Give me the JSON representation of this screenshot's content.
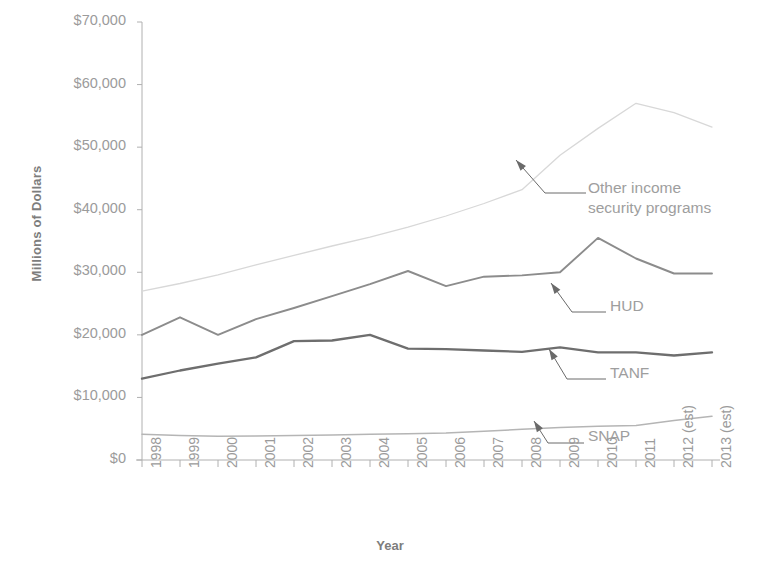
{
  "chart": {
    "type": "line",
    "title": "",
    "xlabel": "Year",
    "ylabel": "Millions of Dollars"
  },
  "axes": {
    "y_ticks": [
      "$0",
      "$10,000",
      "$20,000",
      "$30,000",
      "$40,000",
      "$50,000",
      "$60,000",
      "$70,000"
    ],
    "x_ticks": [
      "1998",
      "1999",
      "2000",
      "2001",
      "2002",
      "2003",
      "2004",
      "2005",
      "2006",
      "2007",
      "2008",
      "2009",
      "2010",
      "2011",
      "2012 (est)",
      "2013 (est)"
    ]
  },
  "annotations": {
    "other_line1": "Other income",
    "other_line2": "security programs",
    "hud": "HUD",
    "tanf": "TANF",
    "snap": "SNAP"
  },
  "colors": {
    "other": "#d8d8d8",
    "hud": "#8c8c8c",
    "tanf": "#6e6e6e",
    "snap": "#b5b5b5",
    "axis": "#b0b0b0",
    "text": "#9b9b9b"
  },
  "chart_data": {
    "type": "line",
    "title": "",
    "xlabel": "Year",
    "ylabel": "Millions of Dollars",
    "ylim": [
      0,
      70000
    ],
    "grid": false,
    "legend_position": "inline-annotations",
    "categories": [
      "1998",
      "1999",
      "2000",
      "2001",
      "2002",
      "2003",
      "2004",
      "2005",
      "2006",
      "2007",
      "2008",
      "2009",
      "2010",
      "2011",
      "2012 (est)",
      "2013 (est)"
    ],
    "series": [
      {
        "name": "Other income security programs",
        "color": "#d8d8d8",
        "values": [
          27000,
          28200,
          29600,
          31200,
          32700,
          34200,
          35600,
          37200,
          39000,
          41000,
          43200,
          48700,
          53000,
          57000,
          55500,
          53200
        ]
      },
      {
        "name": "HUD",
        "color": "#8c8c8c",
        "values": [
          20000,
          22800,
          20000,
          22500,
          24300,
          26200,
          28100,
          30200,
          27800,
          29300,
          29500,
          30000,
          35500,
          32200,
          29800,
          29800
        ]
      },
      {
        "name": "TANF",
        "color": "#6e6e6e",
        "values": [
          13000,
          14300,
          15400,
          16400,
          19000,
          19100,
          20000,
          17800,
          17700,
          17500,
          17300,
          18000,
          17200,
          17200,
          16700,
          17200
        ]
      },
      {
        "name": "SNAP",
        "color": "#b5b5b5",
        "values": [
          4100,
          3900,
          3800,
          3850,
          3900,
          4000,
          4100,
          4200,
          4300,
          4600,
          4900,
          5200,
          5400,
          5500,
          6300,
          7000
        ]
      }
    ]
  }
}
